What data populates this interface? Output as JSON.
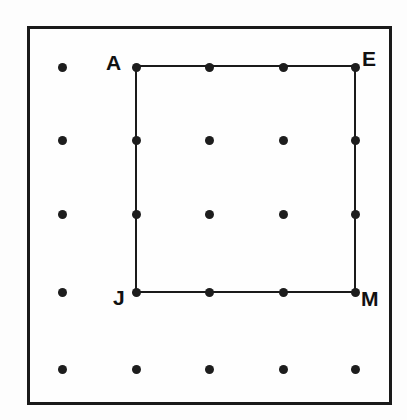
{
  "figure": {
    "background_color": "#fdfdfd",
    "ink_color": "#1a1a1a",
    "frame": {
      "x": 27,
      "y": 26,
      "width": 365,
      "height": 379,
      "stroke_width": 3,
      "stroke_color": "#1a1a1a"
    },
    "dot_grid": {
      "rows": 5,
      "columns": 5,
      "dot_diameter": 9,
      "dot_color": "#1d1d1d",
      "column_x": [
        62,
        136,
        209,
        283,
        355
      ],
      "row_y": [
        67,
        140,
        214,
        292,
        369
      ]
    },
    "polygon": {
      "name": "AEMJ",
      "stroke_width": 2,
      "stroke_color": "#1a1a1a",
      "fill": "none",
      "points": "136,66 355,66 355,292 136,292 136,66"
    },
    "labels": [
      {
        "text": "A",
        "x": 106,
        "y": 52,
        "vertex_x": 136,
        "vertex_y": 66
      },
      {
        "text": "E",
        "x": 362,
        "y": 48,
        "vertex_x": 355,
        "vertex_y": 66
      },
      {
        "text": "J",
        "x": 113,
        "y": 287,
        "vertex_x": 136,
        "vertex_y": 292
      },
      {
        "text": "M",
        "x": 361,
        "y": 288,
        "vertex_x": 355,
        "vertex_y": 292
      }
    ]
  }
}
